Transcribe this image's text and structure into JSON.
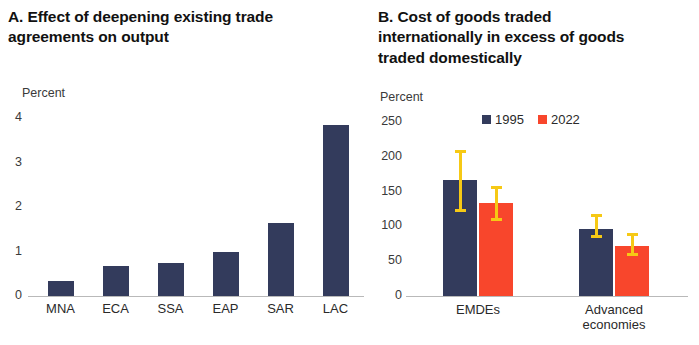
{
  "figure": {
    "panel_a": {
      "title": "A. Effect of deepening existing trade\nagreements on output",
      "axis_unit": "Percent"
    },
    "panel_b": {
      "title": "B. Cost of goods traded\ninternationally in excess of goods\ntraded domestically",
      "axis_unit": "Percent"
    }
  },
  "colors": {
    "navy": "#333b5c",
    "red": "#f8462c",
    "yellow": "#f6c915",
    "axis": "#b9b9b9",
    "text": "#2a2a2a"
  },
  "chart_data": [
    {
      "type": "bar",
      "panel": "A",
      "title": "A. Effect of deepening existing trade agreements on output",
      "xlabel": "",
      "ylabel": "Percent",
      "ylim": [
        0,
        4
      ],
      "yticks": [
        0,
        1,
        2,
        3,
        4
      ],
      "ytick_labels": [
        "0",
        "1",
        "2",
        "3",
        "4"
      ],
      "grid": false,
      "legend": "none",
      "categories": [
        "MNA",
        "ECA",
        "SSA",
        "EAP",
        "SAR",
        "LAC"
      ],
      "values": [
        0.33,
        0.68,
        0.75,
        1.0,
        1.63,
        3.85
      ]
    },
    {
      "type": "bar",
      "panel": "B",
      "title": "B. Cost of goods traded internationally in excess of goods traded domestically",
      "xlabel": "",
      "ylabel": "Percent",
      "ylim": [
        0,
        250
      ],
      "yticks": [
        0,
        50,
        100,
        150,
        200,
        250
      ],
      "ytick_labels": [
        "0",
        "50",
        "100",
        "150",
        "200",
        "250"
      ],
      "grid": false,
      "legend": "top",
      "legend_entries": [
        "1995",
        "2022"
      ],
      "categories": [
        "EMDEs",
        "Advanced\neconomies"
      ],
      "series": [
        {
          "name": "1995",
          "color": "#333b5c",
          "values": [
            167,
            97
          ],
          "error_low": [
            123,
            85
          ],
          "error_high": [
            208,
            115
          ]
        },
        {
          "name": "2022",
          "color": "#f8462c",
          "values": [
            133,
            72
          ],
          "error_low": [
            110,
            60
          ],
          "error_high": [
            156,
            88
          ]
        }
      ]
    }
  ]
}
